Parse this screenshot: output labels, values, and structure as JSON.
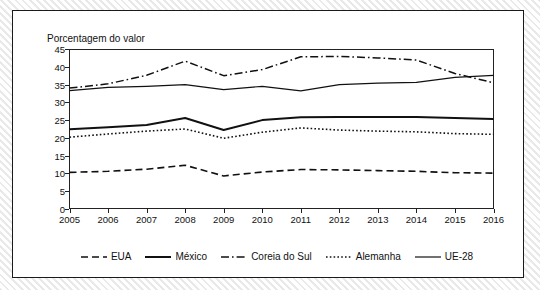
{
  "chart_data": {
    "type": "line",
    "title": "",
    "ylabel": "Porcentagem do valor",
    "xlabel": "",
    "ylim": [
      0,
      45
    ],
    "yticks": [
      0,
      5,
      10,
      15,
      20,
      25,
      30,
      35,
      40,
      45
    ],
    "grid": false,
    "legend_position": "bottom",
    "categories": [
      "2005",
      "2006",
      "2007",
      "2008",
      "2009",
      "2010",
      "2011",
      "2012",
      "2013",
      "2014",
      "2015",
      "2016"
    ],
    "series": [
      {
        "name": "EUA",
        "style": "dashed",
        "color": "#111111",
        "values": [
          10.3,
          10.6,
          11.2,
          12.3,
          9.3,
          10.4,
          11.1,
          11.0,
          10.8,
          10.6,
          10.2,
          10.1
        ]
      },
      {
        "name": "México",
        "style": "solid",
        "color": "#111111",
        "values": [
          22.4,
          23.0,
          23.6,
          25.6,
          22.2,
          25.0,
          25.8,
          25.9,
          25.9,
          25.9,
          25.6,
          25.3
        ]
      },
      {
        "name": "Coreia do Sul",
        "style": "dash-dot",
        "color": "#111111",
        "values": [
          34.0,
          35.2,
          37.6,
          41.6,
          37.5,
          39.2,
          42.8,
          42.9,
          42.5,
          41.9,
          38.1,
          35.5
        ]
      },
      {
        "name": "Alemanha",
        "style": "dotted",
        "color": "#111111",
        "values": [
          20.2,
          21.1,
          21.9,
          22.5,
          19.9,
          21.6,
          22.8,
          22.2,
          21.9,
          21.7,
          21.2,
          21.0
        ]
      },
      {
        "name": "UE-28",
        "style": "solid-thin",
        "color": "#111111",
        "values": [
          33.3,
          34.2,
          34.5,
          35.0,
          33.6,
          34.5,
          33.2,
          35.0,
          35.4,
          35.6,
          37.0,
          37.6
        ]
      }
    ]
  },
  "legend": {
    "items": [
      {
        "label": "EUA",
        "style": "dashed"
      },
      {
        "label": "México",
        "style": "solid"
      },
      {
        "label": "Coreia do Sul",
        "style": "dash-dot"
      },
      {
        "label": "Alemanha",
        "style": "dotted"
      },
      {
        "label": "UE-28",
        "style": "solid-thin"
      }
    ]
  }
}
